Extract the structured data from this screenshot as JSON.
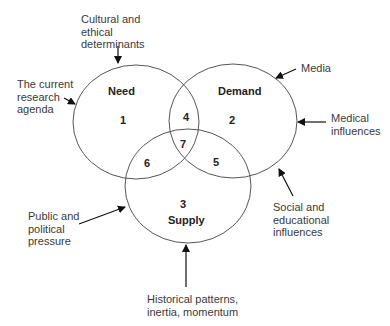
{
  "diagram": {
    "circles": [
      {
        "name": "Need",
        "region": "1"
      },
      {
        "name": "Demand",
        "region": "2"
      },
      {
        "name": "Supply",
        "region": "3"
      }
    ],
    "overlaps": {
      "need_demand": "4",
      "demand_supply": "5",
      "need_supply": "6",
      "all_three": "7"
    },
    "influences": {
      "cultural": [
        "Cultural and",
        "ethical",
        "determinants"
      ],
      "research": [
        "The current",
        "research",
        "agenda"
      ],
      "media": [
        "Media"
      ],
      "medical": [
        "Medical",
        "influences"
      ],
      "social": [
        "Social and",
        "educational",
        "influences"
      ],
      "public": [
        "Public and",
        "political",
        "pressure"
      ],
      "historical": [
        "Historical patterns,",
        "inertia, momentum"
      ]
    },
    "colors": {
      "line": "#555555",
      "arrow": "#111111",
      "text": "#3a3a3a"
    }
  }
}
